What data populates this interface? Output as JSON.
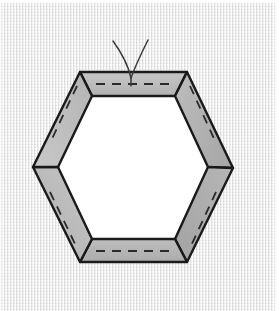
{
  "illustration": {
    "title": "Hexagon patchwork border frame with needle and thread",
    "subject": "hexagon-frame",
    "technique": "english-paper-piecing",
    "caption": ""
  },
  "canvas": {
    "width": 280,
    "height": 311,
    "background_color": "#ececec",
    "texture": "woven-canvas-weave",
    "margin_color": "#ffffff"
  },
  "colors": {
    "outline": "#1a1a1a",
    "strip_fill": "#b3b3b3",
    "strip_fill_light": "#c4c4c4",
    "strip_fill_dark": "#a2a2a2",
    "center_fill": "#ffffff",
    "stitch_dash": "#2b2b2b",
    "thread": "#3a3a3a",
    "background": "#ececec"
  },
  "geometry": {
    "shape": "hexagon",
    "sides": 6,
    "orientation": "pointy-left-right",
    "outer_vertices": [
      [
        80,
        72
      ],
      [
        187,
        72
      ],
      [
        233,
        168
      ],
      [
        187,
        262
      ],
      [
        80,
        262
      ],
      [
        33,
        167
      ]
    ],
    "inner_vertices": [
      [
        92,
        96
      ],
      [
        175,
        96
      ],
      [
        208,
        167
      ],
      [
        175,
        239
      ],
      [
        92,
        239
      ],
      [
        58,
        167
      ]
    ],
    "strip_width_px": 23,
    "outer_width_px": 200,
    "outer_height_px": 190
  },
  "strips": [
    {
      "id": "strip-top",
      "position": "top",
      "label": "Top border strip",
      "outer": "80,72 187,72 175,96 92,96",
      "fill": "#bcbcbc",
      "stitch_line": "96,84 172,84",
      "has_stitch": true
    },
    {
      "id": "strip-upper-right",
      "position": "upper-right",
      "label": "Upper right border strip",
      "outer": "187,72 233,168 208,167 175,96",
      "fill": "#b0b0b0",
      "stitch_line": "190,86 216,143",
      "has_stitch": true
    },
    {
      "id": "strip-lower-right",
      "position": "lower-right",
      "label": "Lower right border strip",
      "outer": "233,168 187,262 175,239 208,167",
      "fill": "#a9a9a9",
      "stitch_line": "216,192 190,248",
      "has_stitch": true
    },
    {
      "id": "strip-bottom",
      "position": "bottom",
      "label": "Bottom border strip",
      "outer": "187,262 80,262 92,239 175,239",
      "fill": "#b4b4b4",
      "stitch_line": "96,251 172,251",
      "has_stitch": true
    },
    {
      "id": "strip-lower-left",
      "position": "lower-left",
      "label": "Lower left border strip",
      "outer": "80,262 33,167 58,167 92,239",
      "fill": "#bdbdbd",
      "stitch_line": "50,192 77,248",
      "has_stitch": true
    },
    {
      "id": "strip-upper-left",
      "position": "upper-left",
      "label": "Upper left border strip",
      "outer": "33,167 80,72 92,96 58,167",
      "fill": "#c0c0c0",
      "stitch_line": "77,86 50,143",
      "has_stitch": true
    }
  ],
  "center": {
    "id": "hexagon-center",
    "label": "Open hexagon center",
    "polygon": "92,96 175,96 208,167 175,239 92,239 58,167",
    "fill": "#ffffff"
  },
  "stitching": {
    "style": "running-stitch",
    "dash_pattern": "9 7",
    "stroke_width": 1.8,
    "color": "#2b2b2b"
  },
  "thread": {
    "label": "Needle thread",
    "strand_count": 2,
    "anchor_point": [
      131,
      78
    ],
    "strand_left_path": "M 131,78 C 128,64 121,52 113,41",
    "strand_right_path": "M 131,78 C 136,64 143,50 148,40",
    "tail_path": "M 131,78 L 131,86",
    "color": "#3a3a3a",
    "stroke_width": 1.5
  }
}
